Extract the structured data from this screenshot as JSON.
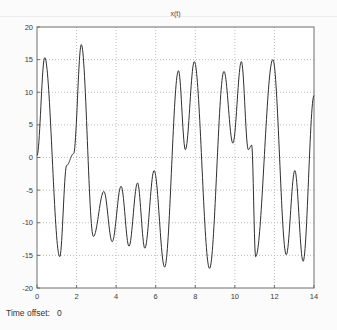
{
  "chart_data": {
    "type": "line",
    "title": "x(t)",
    "xlabel": "",
    "ylabel": "",
    "xlim": [
      0,
      14
    ],
    "ylim": [
      -20,
      20
    ],
    "x_ticks": [
      0,
      2,
      4,
      6,
      8,
      10,
      12,
      14
    ],
    "y_ticks": [
      20,
      15,
      10,
      5,
      0,
      -5,
      -10,
      -15,
      -20
    ],
    "grid": true,
    "legend": "none",
    "series": [
      {
        "name": "x(t)",
        "keypoints": [
          [
            0.0,
            0.3
          ],
          [
            0.39,
            15.3
          ],
          [
            1.15,
            -15.2
          ],
          [
            1.5,
            -1.2
          ],
          [
            1.85,
            0.6
          ],
          [
            2.24,
            17.3
          ],
          [
            2.85,
            -12.1
          ],
          [
            3.38,
            -5.2
          ],
          [
            3.8,
            -12.9
          ],
          [
            4.25,
            -4.4
          ],
          [
            4.65,
            -13.6
          ],
          [
            5.08,
            -3.9
          ],
          [
            5.45,
            -13.9
          ],
          [
            5.92,
            -2.0
          ],
          [
            6.45,
            -16.8
          ],
          [
            7.15,
            13.3
          ],
          [
            7.5,
            1.2
          ],
          [
            7.95,
            14.7
          ],
          [
            8.72,
            -17.0
          ],
          [
            9.45,
            13.2
          ],
          [
            9.9,
            2.2
          ],
          [
            10.33,
            14.7
          ],
          [
            10.68,
            1.2
          ],
          [
            10.85,
            1.9
          ],
          [
            11.05,
            -15.2
          ],
          [
            11.92,
            15.0
          ],
          [
            12.6,
            -14.9
          ],
          [
            13.03,
            -2.0
          ],
          [
            13.45,
            -15.9
          ],
          [
            14.0,
            9.5
          ]
        ]
      }
    ]
  },
  "status_bar": {
    "time_offset_label": "Time offset:",
    "time_offset_value": "0"
  },
  "colors": {
    "background": "#fbfbfb",
    "plot_background": "#ffffff",
    "line": "#2f2f2f",
    "grid": "#bdbdbd",
    "frame": "#6e6e6e",
    "text": "#3a3a3a"
  }
}
